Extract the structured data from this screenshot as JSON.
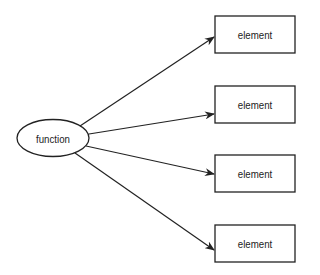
{
  "diagram": {
    "source": {
      "label": "function",
      "shape": "ellipse"
    },
    "targets": [
      {
        "label": "element"
      },
      {
        "label": "element"
      },
      {
        "label": "element"
      },
      {
        "label": "element"
      }
    ],
    "stroke_color": "#222222"
  }
}
